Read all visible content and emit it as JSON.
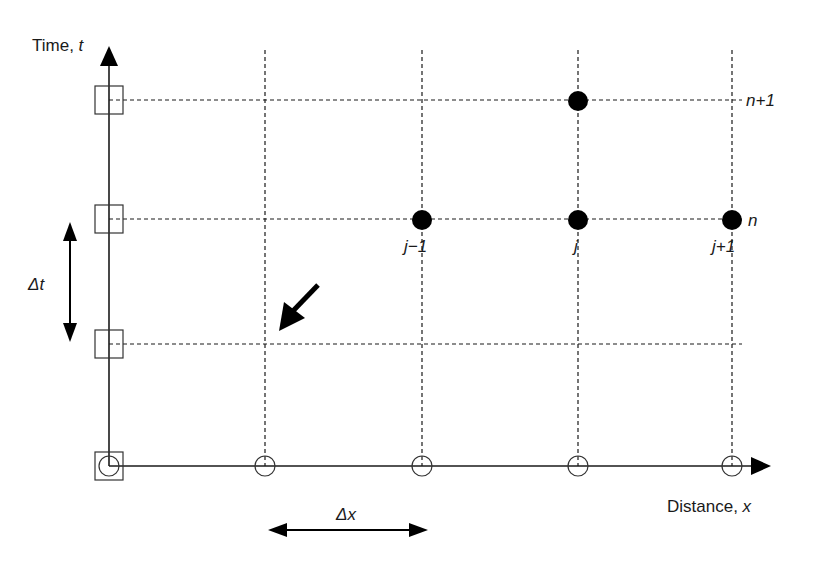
{
  "diagram": {
    "type": "finite-difference-grid",
    "axes": {
      "y_label": "Time, ",
      "y_var": "t",
      "x_label": "Distance, ",
      "x_var": "x"
    },
    "time_step_label": "Δt",
    "space_step_label": "Δx",
    "row_labels": {
      "n": "n",
      "n_plus_1": "n+1"
    },
    "column_labels": {
      "j_minus_1": "j−1",
      "j": "j",
      "j_plus_1": "j+1"
    },
    "grid": {
      "origin": [
        109,
        466
      ],
      "x_positions": [
        265,
        422,
        578,
        732
      ],
      "y_positions": [
        100,
        219,
        344
      ],
      "filled_nodes": [
        {
          "col": "j",
          "row": "n+1"
        },
        {
          "col": "j-1",
          "row": "n"
        },
        {
          "col": "j",
          "row": "n"
        },
        {
          "col": "j+1",
          "row": "n"
        }
      ],
      "boundary_markers_time_axis": "squares",
      "boundary_markers_distance_axis": "circles"
    },
    "colors": {
      "line": "#1a1a1a",
      "node_fill": "#000000",
      "background": "#ffffff"
    }
  }
}
